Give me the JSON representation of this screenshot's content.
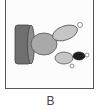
{
  "figure": {
    "panel_label": "B",
    "components": [
      {
        "name": "cylinder",
        "color": "#7a7a7a"
      },
      {
        "name": "large-ellipse",
        "color": "#a8a8a8"
      },
      {
        "name": "upper-ellipse",
        "color": "#c4c4c4"
      },
      {
        "name": "lower-ellipse",
        "color": "#c4c4c4"
      },
      {
        "name": "dark-ellipse",
        "color": "#222222"
      }
    ]
  }
}
